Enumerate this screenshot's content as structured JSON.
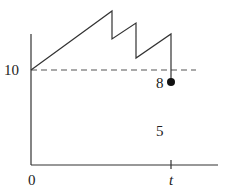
{
  "diagram": {
    "y_label_10": "10",
    "label_8": "8",
    "label_5": "5",
    "x_label_0": "0",
    "x_label_t": "t",
    "line_color": "#333333",
    "dot_color": "#111111"
  }
}
